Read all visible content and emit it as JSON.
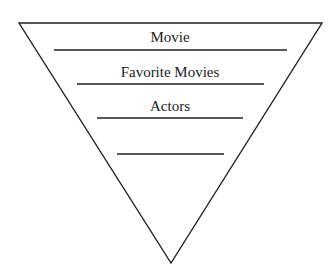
{
  "diagram": {
    "type": "inverted-funnel",
    "levels": [
      {
        "label": "Movie"
      },
      {
        "label": "Favorite Movies"
      },
      {
        "label": "Actors"
      },
      {
        "label": ""
      }
    ],
    "colors": {
      "stroke": "#222222",
      "background": "#ffffff"
    }
  }
}
